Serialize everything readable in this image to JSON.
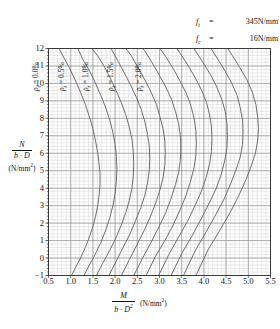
{
  "chart_data": {
    "type": "line",
    "title": "",
    "xlabel": "M / (b·D²)",
    "ylabel": "N / (b·D)",
    "xunit": "(N/mm²)",
    "yunit": "(N/mm²)",
    "xlim": [
      0.5,
      5.5
    ],
    "ylim": [
      -1,
      12
    ],
    "xticks": [
      "0.5",
      "1.0",
      "1.5",
      "2.0",
      "2.5",
      "3.0",
      "3.5",
      "4.0",
      "4.5",
      "5.0",
      "5.5"
    ],
    "yticks": [
      "12",
      "11",
      "10",
      "9",
      "8",
      "7",
      "6",
      "5",
      "4",
      "3",
      "2",
      "1",
      "0",
      "-1"
    ],
    "xtick_values": [
      0.5,
      1.0,
      1.5,
      2.0,
      2.5,
      3.0,
      3.5,
      4.0,
      4.5,
      5.0,
      5.5
    ],
    "ytick_values": [
      12,
      11,
      10,
      9,
      8,
      7,
      6,
      5,
      4,
      3,
      2,
      1,
      0,
      -1
    ],
    "grid": true,
    "grid_major_x": 0.5,
    "grid_major_y": 1,
    "grid_minor_divisions": 5,
    "legend_position": "top-inside-rotated",
    "annotations": [
      {
        "name": "ft",
        "symbol": "f",
        "subscript": "t",
        "value": "345N/mm",
        "exponent": "2"
      },
      {
        "name": "fc",
        "symbol": "f",
        "subscript": "c",
        "value": "16N/mm",
        "exponent": "2"
      }
    ],
    "series_label_prefix": "ρ",
    "series_label_subscript": "t",
    "series": [
      {
        "name": "rho-t-0.0",
        "label": "0.0%",
        "rho": 0.0,
        "points": [
          [
            1.02,
            -1.0
          ],
          [
            1.12,
            -0.5
          ],
          [
            1.22,
            0.0
          ],
          [
            1.33,
            0.6
          ],
          [
            1.42,
            1.2
          ],
          [
            1.5,
            1.8
          ],
          [
            1.56,
            2.4
          ],
          [
            1.61,
            3.0
          ],
          [
            1.64,
            3.6
          ],
          [
            1.66,
            4.2
          ],
          [
            1.66,
            4.8
          ],
          [
            1.64,
            5.4
          ],
          [
            1.61,
            6.0
          ],
          [
            1.56,
            6.7
          ],
          [
            1.5,
            7.4
          ],
          [
            1.42,
            8.1
          ],
          [
            1.33,
            8.8
          ],
          [
            1.22,
            9.5
          ],
          [
            1.1,
            10.2
          ],
          [
            0.97,
            10.9
          ],
          [
            0.84,
            11.5
          ],
          [
            0.74,
            12.0
          ]
        ]
      },
      {
        "name": "rho-t-0.25",
        "label": "",
        "rho": 0.25,
        "points": [
          [
            1.3,
            -1.0
          ],
          [
            1.42,
            -0.4
          ],
          [
            1.55,
            0.2
          ],
          [
            1.68,
            0.9
          ],
          [
            1.79,
            1.6
          ],
          [
            1.88,
            2.3
          ],
          [
            1.95,
            3.0
          ],
          [
            2.0,
            3.7
          ],
          [
            2.03,
            4.4
          ],
          [
            2.04,
            5.1
          ],
          [
            2.03,
            5.8
          ],
          [
            2.0,
            6.5
          ],
          [
            1.95,
            7.2
          ],
          [
            1.88,
            7.9
          ],
          [
            1.79,
            8.6
          ],
          [
            1.68,
            9.3
          ],
          [
            1.56,
            10.0
          ],
          [
            1.43,
            10.7
          ],
          [
            1.29,
            11.3
          ],
          [
            1.16,
            12.0
          ]
        ]
      },
      {
        "name": "rho-t-0.5",
        "label": "0.5%",
        "rho": 0.5,
        "points": [
          [
            1.58,
            -1.0
          ],
          [
            1.72,
            -0.3
          ],
          [
            1.87,
            0.4
          ],
          [
            2.01,
            1.1
          ],
          [
            2.14,
            1.9
          ],
          [
            2.24,
            2.6
          ],
          [
            2.32,
            3.3
          ],
          [
            2.38,
            4.0
          ],
          [
            2.41,
            4.7
          ],
          [
            2.42,
            5.4
          ],
          [
            2.41,
            6.1
          ],
          [
            2.38,
            6.8
          ],
          [
            2.32,
            7.5
          ],
          [
            2.24,
            8.2
          ],
          [
            2.14,
            8.9
          ],
          [
            2.02,
            9.6
          ],
          [
            1.89,
            10.3
          ],
          [
            1.75,
            11.0
          ],
          [
            1.6,
            11.6
          ],
          [
            1.48,
            12.0
          ]
        ]
      },
      {
        "name": "rho-t-0.75",
        "label": "",
        "rho": 0.75,
        "points": [
          [
            1.86,
            -1.0
          ],
          [
            2.02,
            -0.2
          ],
          [
            2.18,
            0.6
          ],
          [
            2.34,
            1.4
          ],
          [
            2.47,
            2.2
          ],
          [
            2.58,
            2.9
          ],
          [
            2.67,
            3.6
          ],
          [
            2.73,
            4.3
          ],
          [
            2.77,
            5.0
          ],
          [
            2.78,
            5.7
          ],
          [
            2.77,
            6.4
          ],
          [
            2.73,
            7.1
          ],
          [
            2.67,
            7.8
          ],
          [
            2.59,
            8.5
          ],
          [
            2.48,
            9.2
          ],
          [
            2.35,
            9.9
          ],
          [
            2.21,
            10.6
          ],
          [
            2.06,
            11.3
          ],
          [
            1.91,
            12.0
          ]
        ]
      },
      {
        "name": "rho-t-1.0",
        "label": "1.0%",
        "rho": 1.0,
        "points": [
          [
            2.14,
            -1.0
          ],
          [
            2.32,
            -0.1
          ],
          [
            2.5,
            0.8
          ],
          [
            2.66,
            1.6
          ],
          [
            2.8,
            2.4
          ],
          [
            2.92,
            3.2
          ],
          [
            3.01,
            3.9
          ],
          [
            3.08,
            4.6
          ],
          [
            3.12,
            5.3
          ],
          [
            3.13,
            6.0
          ],
          [
            3.12,
            6.7
          ],
          [
            3.08,
            7.4
          ],
          [
            3.01,
            8.1
          ],
          [
            2.93,
            8.8
          ],
          [
            2.81,
            9.5
          ],
          [
            2.67,
            10.2
          ],
          [
            2.52,
            10.9
          ],
          [
            2.36,
            11.6
          ],
          [
            2.24,
            12.0
          ]
        ]
      },
      {
        "name": "rho-t-1.25",
        "label": "",
        "rho": 1.25,
        "points": [
          [
            2.42,
            -1.0
          ],
          [
            2.62,
            0.0
          ],
          [
            2.81,
            0.9
          ],
          [
            2.99,
            1.8
          ],
          [
            3.14,
            2.6
          ],
          [
            3.26,
            3.4
          ],
          [
            3.36,
            4.2
          ],
          [
            3.43,
            4.9
          ],
          [
            3.47,
            5.6
          ],
          [
            3.48,
            6.3
          ],
          [
            3.47,
            7.0
          ],
          [
            3.43,
            7.7
          ],
          [
            3.36,
            8.4
          ],
          [
            3.27,
            9.1
          ],
          [
            3.14,
            9.8
          ],
          [
            2.99,
            10.5
          ],
          [
            2.83,
            11.2
          ],
          [
            2.66,
            11.9
          ],
          [
            2.61,
            12.0
          ]
        ]
      },
      {
        "name": "rho-t-1.5",
        "label": "1.5%",
        "rho": 1.5,
        "points": [
          [
            2.7,
            -1.0
          ],
          [
            2.91,
            0.1
          ],
          [
            3.12,
            1.0
          ],
          [
            3.31,
            1.9
          ],
          [
            3.47,
            2.8
          ],
          [
            3.6,
            3.6
          ],
          [
            3.7,
            4.4
          ],
          [
            3.78,
            5.2
          ],
          [
            3.82,
            5.9
          ],
          [
            3.83,
            6.6
          ],
          [
            3.82,
            7.3
          ],
          [
            3.78,
            8.0
          ],
          [
            3.71,
            8.7
          ],
          [
            3.61,
            9.4
          ],
          [
            3.47,
            10.1
          ],
          [
            3.32,
            10.8
          ],
          [
            3.15,
            11.5
          ],
          [
            3.01,
            12.0
          ]
        ]
      },
      {
        "name": "rho-t-1.75",
        "label": "",
        "rho": 1.75,
        "points": [
          [
            2.98,
            -1.0
          ],
          [
            3.21,
            0.2
          ],
          [
            3.43,
            1.2
          ],
          [
            3.63,
            2.1
          ],
          [
            3.8,
            3.0
          ],
          [
            3.94,
            3.8
          ],
          [
            4.05,
            4.6
          ],
          [
            4.13,
            5.4
          ],
          [
            4.17,
            6.1
          ],
          [
            4.18,
            6.8
          ],
          [
            4.17,
            7.5
          ],
          [
            4.13,
            8.2
          ],
          [
            4.06,
            8.9
          ],
          [
            3.95,
            9.6
          ],
          [
            3.81,
            10.3
          ],
          [
            3.65,
            11.0
          ],
          [
            3.47,
            11.7
          ],
          [
            3.39,
            12.0
          ]
        ]
      },
      {
        "name": "rho-t-2.0",
        "label": "2.0%",
        "rho": 2.0,
        "points": [
          [
            3.26,
            -1.0
          ],
          [
            3.51,
            0.3
          ],
          [
            3.74,
            1.3
          ],
          [
            3.95,
            2.3
          ],
          [
            4.13,
            3.2
          ],
          [
            4.28,
            4.0
          ],
          [
            4.39,
            4.8
          ],
          [
            4.47,
            5.6
          ],
          [
            4.52,
            6.3
          ],
          [
            4.53,
            7.0
          ],
          [
            4.52,
            7.7
          ],
          [
            4.48,
            8.4
          ],
          [
            4.4,
            9.1
          ],
          [
            4.29,
            9.8
          ],
          [
            4.15,
            10.5
          ],
          [
            3.98,
            11.2
          ],
          [
            3.8,
            11.9
          ],
          [
            3.78,
            12.0
          ]
        ]
      },
      {
        "name": "rho-t-2.25",
        "label": "",
        "rho": 2.25,
        "points": [
          [
            3.54,
            -1.0
          ],
          [
            3.8,
            0.4
          ],
          [
            4.05,
            1.5
          ],
          [
            4.27,
            2.5
          ],
          [
            4.46,
            3.4
          ],
          [
            4.61,
            4.3
          ],
          [
            4.73,
            5.1
          ],
          [
            4.82,
            5.8
          ],
          [
            4.87,
            6.5
          ],
          [
            4.88,
            7.2
          ],
          [
            4.87,
            7.9
          ],
          [
            4.82,
            8.6
          ],
          [
            4.75,
            9.3
          ],
          [
            4.63,
            10.0
          ],
          [
            4.48,
            10.7
          ],
          [
            4.31,
            11.4
          ],
          [
            4.16,
            12.0
          ]
        ]
      },
      {
        "name": "rho-t-2.5",
        "label": "",
        "rho": 2.5,
        "points": [
          [
            3.82,
            -1.0
          ],
          [
            4.1,
            0.5
          ],
          [
            4.36,
            1.6
          ],
          [
            4.59,
            2.6
          ],
          [
            4.79,
            3.6
          ],
          [
            4.95,
            4.5
          ],
          [
            5.07,
            5.3
          ],
          [
            5.16,
            6.0
          ],
          [
            5.21,
            6.7
          ],
          [
            5.23,
            7.4
          ],
          [
            5.21,
            8.1
          ],
          [
            5.17,
            8.8
          ],
          [
            5.09,
            9.5
          ],
          [
            4.97,
            10.2
          ],
          [
            4.81,
            10.9
          ],
          [
            4.64,
            11.6
          ],
          [
            4.54,
            12.0
          ]
        ]
      }
    ]
  },
  "rho_labels": [
    {
      "name": "rho-label-0",
      "text": "= 0.0%",
      "x": 1.16
    },
    {
      "name": "rho-label-1",
      "text": "= 0.5%",
      "x": 1.76
    },
    {
      "name": "rho-label-2",
      "text": "= 1.0%",
      "x": 2.3
    },
    {
      "name": "rho-label-3",
      "text": "= 1.5%",
      "x": 2.86
    },
    {
      "name": "rho-label-4",
      "text": "= 2.0%",
      "x": 3.48
    }
  ],
  "material_note": {
    "ft_label": "f",
    "ft_sub": "t",
    "ft_eq": "=",
    "ft_value": "345N/mm",
    "ft_exp": "2",
    "fc_label": "f",
    "fc_sub": "c",
    "fc_eq": "=",
    "fc_value": "16N/mm",
    "fc_exp": "2"
  },
  "axis_titles": {
    "y_num": "N",
    "y_den": "b · D",
    "y_unit": "(N/mm",
    "y_unit_exp": "2",
    "y_unit_tail": ")",
    "x_num": "M",
    "x_den": "b · D",
    "x_den_exp": "2",
    "x_unit": "(N/mm",
    "x_unit_exp": "2",
    "x_unit_tail": ")"
  },
  "colors": {
    "curve": "#6d6d6d",
    "grid_major": "#8d8d8d",
    "grid_minor": "#c9c9c9",
    "axis": "#3a3a3a",
    "text": "#111111"
  }
}
